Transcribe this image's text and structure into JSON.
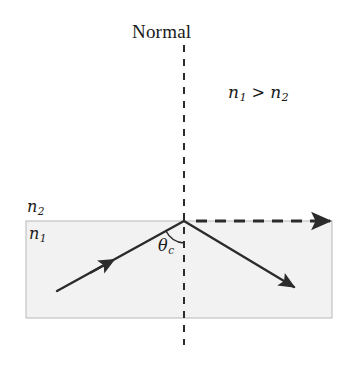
{
  "figure": {
    "title_label": "Normal",
    "background_color": "#ffffff",
    "stroke_color": "#2b2b2b",
    "medium_fill_color": "#f2f2f2",
    "medium_border_color": "#b8b8b8"
  },
  "labels": {
    "normal": "Normal",
    "index_high": "n",
    "index_high_sub": "1",
    "index_low": "n",
    "index_low_sub": "2",
    "greater_than": ">",
    "critical_angle": "θ",
    "critical_angle_sub": "c"
  },
  "regions": {
    "upper_medium_label": "n",
    "upper_medium_sub": "2",
    "lower_medium_label": "n",
    "lower_medium_sub": "1"
  },
  "rays": {
    "incident": {
      "name": "incident-ray",
      "style": "solid",
      "start": [
        57,
        291
      ],
      "end": [
        184,
        221
      ]
    },
    "reflected": {
      "name": "reflected-ray",
      "style": "solid",
      "start": [
        184,
        221
      ],
      "end": [
        301,
        291
      ]
    },
    "refracted_grazing": {
      "name": "refracted-grazing-ray",
      "style": "dashed",
      "start": [
        196,
        221
      ],
      "end": [
        338,
        221
      ]
    },
    "normal_line": {
      "name": "normal-line",
      "style": "dashed",
      "start": [
        184,
        45
      ],
      "end": [
        184,
        345
      ]
    }
  },
  "interface": {
    "vertex": [
      184,
      221
    ],
    "slab_left": 26,
    "slab_right": 332,
    "slab_top": 221,
    "slab_bottom": 318
  }
}
